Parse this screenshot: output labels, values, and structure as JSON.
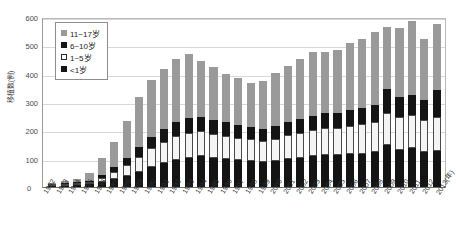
{
  "chart_data": {
    "type": "bar",
    "subtype": "stacked-bar",
    "title": "",
    "xlabel": "(年)",
    "ylabel": "移植数(例)",
    "ylim": [
      0,
      600
    ],
    "ytick_values": [
      0,
      100,
      200,
      300,
      400,
      500,
      600
    ],
    "ytick_labels": [
      "0",
      "100",
      "200",
      "300",
      "400",
      "500",
      "600"
    ],
    "grid": true,
    "legend_position": "top-left",
    "categories": [
      "1982",
      "1983",
      "1984",
      "1985",
      "1986",
      "1987",
      "1988",
      "1989",
      "1990",
      "1991",
      "1992",
      "1993",
      "1994",
      "1995",
      "1996",
      "1997",
      "1998",
      "1999",
      "2000",
      "2001",
      "2002",
      "2003",
      "2004",
      "2005",
      "2006",
      "2007",
      "2008",
      "2009",
      "2010",
      "2011",
      "2012",
      "2013"
    ],
    "series": [
      {
        "name": "<1岁",
        "color": "#141414",
        "values": [
          2,
          4,
          6,
          10,
          18,
          28,
          38,
          52,
          70,
          84,
          96,
          104,
          108,
          104,
          100,
          96,
          92,
          88,
          92,
          98,
          104,
          110,
          112,
          112,
          116,
          118,
          122,
          150,
          132,
          136,
          124,
          128
        ]
      },
      {
        "name": "1~5岁",
        "color": "#f4f4f4",
        "values": [
          1,
          2,
          4,
          8,
          14,
          26,
          38,
          54,
          66,
          76,
          84,
          86,
          88,
          84,
          80,
          78,
          76,
          74,
          78,
          84,
          88,
          92,
          96,
          96,
          100,
          104,
          108,
          112,
          116,
          118,
          114,
          120
        ]
      },
      {
        "name": "6~10岁",
        "color": "#141414",
        "values": [
          1,
          2,
          3,
          5,
          10,
          18,
          26,
          34,
          42,
          46,
          50,
          52,
          52,
          50,
          48,
          46,
          44,
          42,
          44,
          46,
          48,
          50,
          52,
          54,
          56,
          58,
          60,
          84,
          68,
          72,
          70,
          96
        ]
      },
      {
        "name": "11~17岁",
        "color": "#9a9a9a",
        "values": [
          4,
          8,
          14,
          27,
          60,
          88,
          130,
          178,
          200,
          212,
          222,
          226,
          196,
          186,
          172,
          164,
          156,
          170,
          190,
          198,
          212,
          226,
          218,
          222,
          238,
          244,
          256,
          218,
          244,
          260,
          214,
          230
        ]
      }
    ],
    "totals": [
      8,
      16,
      27,
      50,
      102,
      160,
      232,
      318,
      378,
      418,
      452,
      468,
      444,
      424,
      400,
      384,
      368,
      374,
      404,
      426,
      452,
      478,
      478,
      484,
      510,
      524,
      546,
      564,
      560,
      586,
      522,
      574
    ]
  },
  "legend": {
    "items": [
      {
        "label": "11~17岁",
        "swatch": "gray-swatch"
      },
      {
        "label": "6~10岁",
        "swatch": "black-swatch"
      },
      {
        "label": "1~5岁",
        "swatch": "white-swatch"
      },
      {
        "label": "<1岁",
        "swatch": "black-swatch"
      }
    ]
  },
  "axes": {
    "y_title": "移植数(例)",
    "x_unit": "(年)",
    "zero_label": "0"
  }
}
